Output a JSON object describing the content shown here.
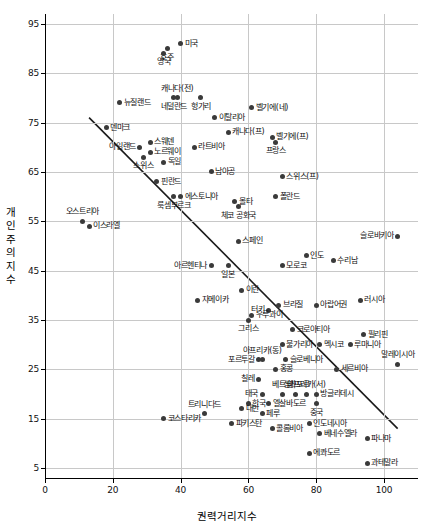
{
  "chart_data": {
    "type": "scatter",
    "title": "",
    "xlabel": "권력거리지수",
    "ylabel": "개인주의지수",
    "xlim": [
      0,
      110
    ],
    "ylim": [
      3,
      97
    ],
    "xticks": [
      0,
      20,
      40,
      60,
      80,
      100
    ],
    "yticks": [
      5,
      15,
      25,
      35,
      45,
      55,
      65,
      75,
      85,
      95
    ],
    "grid": true,
    "legend": "none",
    "trendline": {
      "x1": 13,
      "y1": 76,
      "x2": 104,
      "y2": 13
    },
    "points": [
      {
        "label": "미국",
        "x": 40,
        "y": 91,
        "lp": "r"
      },
      {
        "label": "호주",
        "x": 36,
        "y": 90,
        "lp": "b"
      },
      {
        "label": "영국",
        "x": 35,
        "y": 89,
        "lp": "b"
      },
      {
        "label": "캐나다(전)",
        "x": 39,
        "y": 80,
        "lp": "t"
      },
      {
        "label": "네덜란드",
        "x": 38,
        "y": 80,
        "lp": "b"
      },
      {
        "label": "뉴질랜드",
        "x": 22,
        "y": 79,
        "lp": "r"
      },
      {
        "label": "헝가리",
        "x": 46,
        "y": 80,
        "lp": "b"
      },
      {
        "label": "벨기에(네)",
        "x": 61,
        "y": 78,
        "lp": "r"
      },
      {
        "label": "이탈리아",
        "x": 50,
        "y": 76,
        "lp": "r"
      },
      {
        "label": "덴마크",
        "x": 18,
        "y": 74,
        "lp": "r"
      },
      {
        "label": "캐나다(프)",
        "x": 54,
        "y": 73,
        "lp": "r"
      },
      {
        "label": "벨기에(프)",
        "x": 67,
        "y": 72,
        "lp": "r"
      },
      {
        "label": "프랑스",
        "x": 68,
        "y": 71,
        "lp": "b"
      },
      {
        "label": "스웨덴",
        "x": 31,
        "y": 71,
        "lp": "r"
      },
      {
        "label": "아일랜드",
        "x": 28,
        "y": 70,
        "lp": "l"
      },
      {
        "label": "라트비아",
        "x": 44,
        "y": 70,
        "lp": "r"
      },
      {
        "label": "노르웨이",
        "x": 31,
        "y": 69,
        "lp": "r"
      },
      {
        "label": "스위스",
        "x": 29,
        "y": 68,
        "lp": "b"
      },
      {
        "label": "독일",
        "x": 35,
        "y": 67,
        "lp": "r"
      },
      {
        "label": "남아공",
        "x": 49,
        "y": 65,
        "lp": "r"
      },
      {
        "label": "스위스(프)",
        "x": 70,
        "y": 64,
        "lp": "r"
      },
      {
        "label": "핀란드",
        "x": 33,
        "y": 63,
        "lp": "r"
      },
      {
        "label": "에스토니아",
        "x": 40,
        "y": 60,
        "lp": "r"
      },
      {
        "label": "룩셈부르크",
        "x": 38,
        "y": 60,
        "lp": "b"
      },
      {
        "label": "폴란드",
        "x": 68,
        "y": 60,
        "lp": "r"
      },
      {
        "label": "몰타",
        "x": 56,
        "y": 59,
        "lp": "r"
      },
      {
        "label": "체코 공화국",
        "x": 57,
        "y": 58,
        "lp": "b"
      },
      {
        "label": "오스트리아",
        "x": 11,
        "y": 55,
        "lp": "t"
      },
      {
        "label": "이스라엘",
        "x": 13,
        "y": 54,
        "lp": "r"
      },
      {
        "label": "슬로바키아",
        "x": 104,
        "y": 52,
        "lp": "l"
      },
      {
        "label": "스페인",
        "x": 57,
        "y": 51,
        "lp": "r"
      },
      {
        "label": "인도",
        "x": 77,
        "y": 48,
        "lp": "r"
      },
      {
        "label": "아르헨티나",
        "x": 49,
        "y": 46,
        "lp": "l"
      },
      {
        "label": "수리남",
        "x": 85,
        "y": 47,
        "lp": "r"
      },
      {
        "label": "모로코",
        "x": 70,
        "y": 46,
        "lp": "r"
      },
      {
        "label": "일본",
        "x": 54,
        "y": 46,
        "lp": "b"
      },
      {
        "label": "이란",
        "x": 58,
        "y": 41,
        "lp": "r"
      },
      {
        "label": "러시아",
        "x": 93,
        "y": 39,
        "lp": "r"
      },
      {
        "label": "자메이카",
        "x": 45,
        "y": 39,
        "lp": "r"
      },
      {
        "label": "브라질",
        "x": 69,
        "y": 38,
        "lp": "r"
      },
      {
        "label": "아랍어권",
        "x": 80,
        "y": 38,
        "lp": "r"
      },
      {
        "label": "터키",
        "x": 66,
        "y": 37,
        "lp": "l"
      },
      {
        "label": "필리핀",
        "x": 94,
        "y": 32,
        "lp": "r"
      },
      {
        "label": "우루과이",
        "x": 61,
        "y": 36,
        "lp": "r"
      },
      {
        "label": "그리스",
        "x": 60,
        "y": 35,
        "lp": "b"
      },
      {
        "label": "크로아티아",
        "x": 73,
        "y": 33,
        "lp": "r"
      },
      {
        "label": "불가리아",
        "x": 70,
        "y": 30,
        "lp": "r"
      },
      {
        "label": "멕시코",
        "x": 81,
        "y": 30,
        "lp": "r"
      },
      {
        "label": "루마니아",
        "x": 90,
        "y": 30,
        "lp": "r"
      },
      {
        "label": "아프리카(동)",
        "x": 64,
        "y": 27,
        "lp": "t"
      },
      {
        "label": "포르투갈",
        "x": 63,
        "y": 27,
        "lp": "l"
      },
      {
        "label": "슬로베니아",
        "x": 71,
        "y": 27,
        "lp": "r"
      },
      {
        "label": "말레이시아",
        "x": 104,
        "y": 26,
        "lp": "t"
      },
      {
        "label": "홍콩",
        "x": 68,
        "y": 25,
        "lp": "r"
      },
      {
        "label": "세르비아",
        "x": 86,
        "y": 25,
        "lp": "r"
      },
      {
        "label": "칠레",
        "x": 63,
        "y": 23,
        "lp": "l"
      },
      {
        "label": "싱가포르",
        "x": 74,
        "y": 20,
        "lp": "t"
      },
      {
        "label": "베트남",
        "x": 70,
        "y": 20,
        "lp": "t"
      },
      {
        "label": "아프리카(서)",
        "x": 77,
        "y": 20,
        "lp": "t"
      },
      {
        "label": "태국",
        "x": 64,
        "y": 20,
        "lp": "l"
      },
      {
        "label": "방글라데시",
        "x": 80,
        "y": 20,
        "lp": "r"
      },
      {
        "label": "한국",
        "x": 60,
        "y": 18,
        "lp": "r"
      },
      {
        "label": "엘살바도르",
        "x": 66,
        "y": 18,
        "lp": "r"
      },
      {
        "label": "중국",
        "x": 80,
        "y": 18,
        "lp": "b"
      },
      {
        "label": "대만",
        "x": 58,
        "y": 17,
        "lp": "r"
      },
      {
        "label": "페루",
        "x": 64,
        "y": 16,
        "lp": "r"
      },
      {
        "label": "트리니다드",
        "x": 47,
        "y": 16,
        "lp": "t"
      },
      {
        "label": "코스타리카",
        "x": 35,
        "y": 15,
        "lp": "r"
      },
      {
        "label": "파키스탄",
        "x": 55,
        "y": 14,
        "lp": "r"
      },
      {
        "label": "인도네시아",
        "x": 78,
        "y": 14,
        "lp": "r"
      },
      {
        "label": "콜롬비아",
        "x": 67,
        "y": 13,
        "lp": "r"
      },
      {
        "label": "베네수엘라",
        "x": 81,
        "y": 12,
        "lp": "r"
      },
      {
        "label": "파나마",
        "x": 95,
        "y": 11,
        "lp": "r"
      },
      {
        "label": "에콰도르",
        "x": 78,
        "y": 8,
        "lp": "r"
      },
      {
        "label": "과테말라",
        "x": 95,
        "y": 6,
        "lp": "r"
      }
    ]
  },
  "colors": {
    "point": "#3a3a3a",
    "grid": "#c8c8c8",
    "axis": "#000000",
    "trend": "#1a1a1a"
  }
}
